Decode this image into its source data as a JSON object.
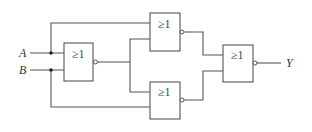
{
  "diagram": {
    "type": "logic-circuit",
    "inputs": [
      {
        "id": "A",
        "label": "A"
      },
      {
        "id": "B",
        "label": "B"
      }
    ],
    "output": {
      "id": "Y",
      "label": "Y"
    },
    "gates": [
      {
        "id": "g1",
        "symbol": "≥1",
        "kind": "NOR",
        "inputs": [
          "A",
          "B"
        ]
      },
      {
        "id": "g2",
        "symbol": "≥1",
        "kind": "NOR",
        "inputs": [
          "A",
          "g1"
        ]
      },
      {
        "id": "g3",
        "symbol": "≥1",
        "kind": "NOR",
        "inputs": [
          "g1",
          "B"
        ]
      },
      {
        "id": "g4",
        "symbol": "≥1",
        "kind": "NOR",
        "inputs": [
          "g2",
          "g3"
        ],
        "output": "Y"
      }
    ]
  }
}
